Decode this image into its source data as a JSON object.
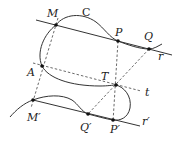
{
  "figure": {
    "type": "geometry-diagram",
    "curve_label": "C",
    "lines": {
      "r": {
        "label": "r"
      },
      "r_prime": {
        "label": "r′"
      },
      "t": {
        "label": "t"
      }
    },
    "points": {
      "M": {
        "label": "M",
        "x": 56,
        "y": 25
      },
      "P": {
        "label": "P",
        "x": 118,
        "y": 41
      },
      "Q": {
        "label": "Q",
        "x": 149,
        "y": 49
      },
      "A": {
        "label": "A",
        "x": 42,
        "y": 66
      },
      "T": {
        "label": "T",
        "x": 116,
        "y": 85
      },
      "M_prime": {
        "label": "M′",
        "x": 33,
        "y": 100
      },
      "Q_prime": {
        "label": "Q′",
        "x": 88,
        "y": 114
      },
      "P_prime": {
        "label": "P′",
        "x": 113,
        "y": 120
      }
    },
    "colors": {
      "stroke": "#333333",
      "background": "#ffffff"
    }
  }
}
